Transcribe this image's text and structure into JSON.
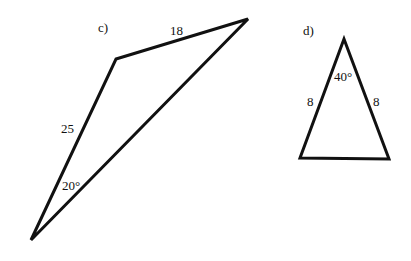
{
  "figures": [
    {
      "label": "c)",
      "vertices": [
        [
          116,
          59
        ],
        [
          248,
          19
        ],
        [
          31,
          240
        ]
      ],
      "side_labels": [
        "18",
        "25"
      ],
      "angle_label": "20°"
    },
    {
      "label": "d)",
      "vertices": [
        [
          344,
          39
        ],
        [
          300,
          158
        ],
        [
          389,
          159
        ]
      ],
      "side_labels": [
        "8",
        "8"
      ],
      "angle_label": "40°"
    }
  ],
  "colors": {
    "stroke": "#111111",
    "background": "#ffffff"
  }
}
